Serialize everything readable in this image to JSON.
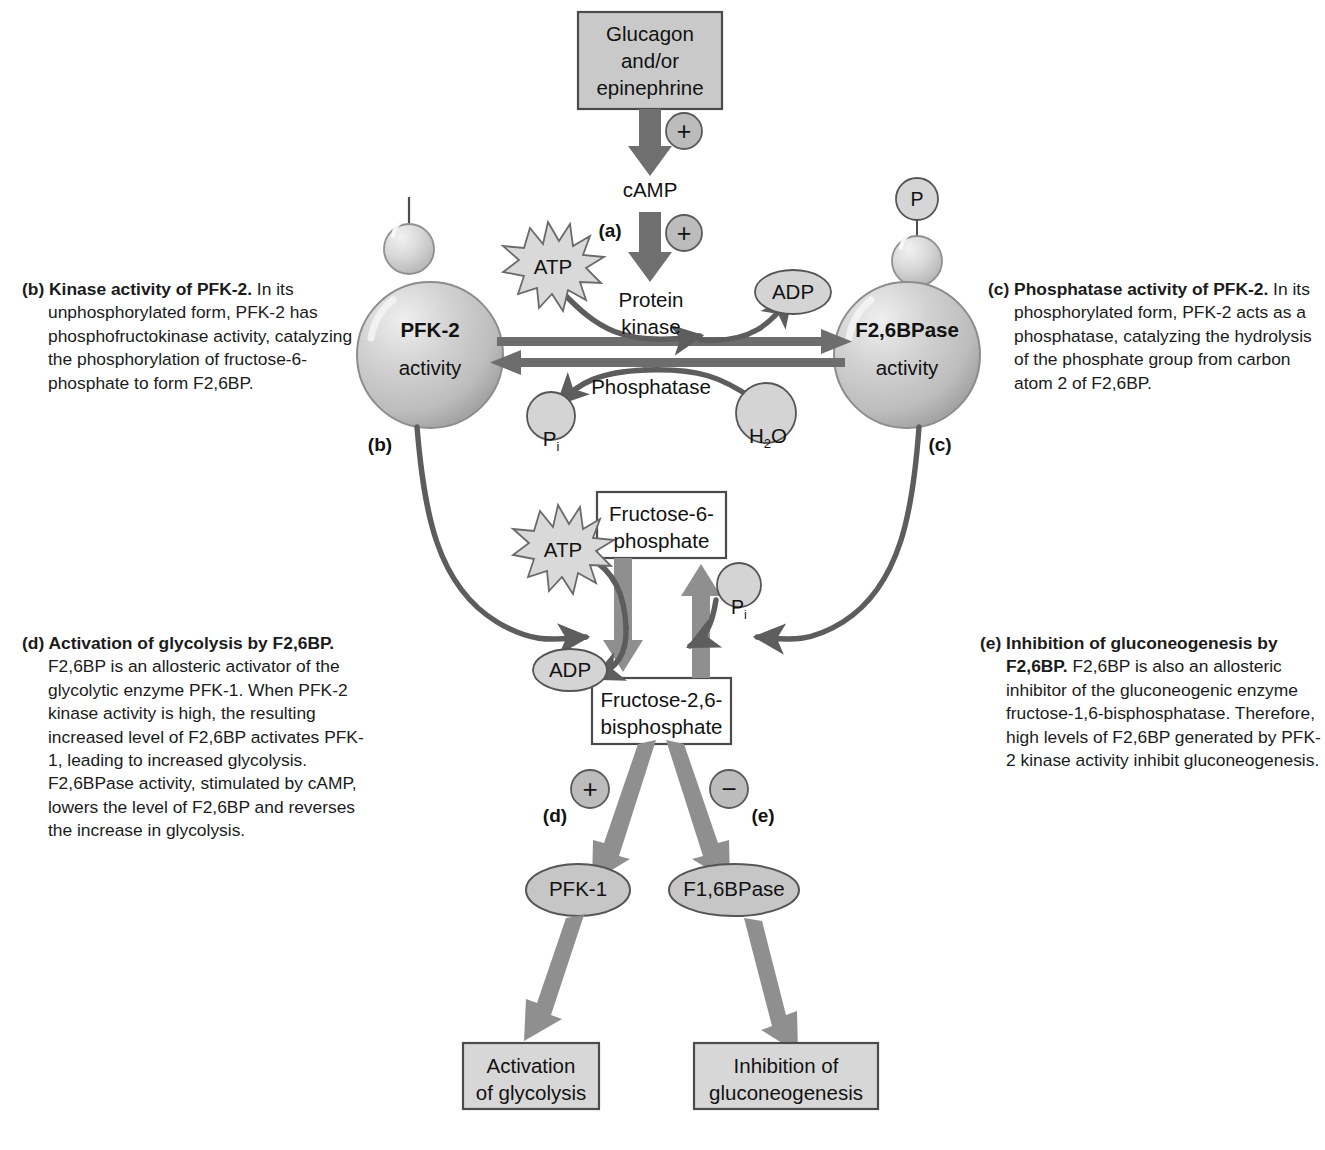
{
  "figure": {
    "colors": {
      "box_fill": "#c9c9c9",
      "box_fill_light": "#ffffff",
      "box_stroke": "#4e4e4e",
      "arrow_gray": "#7c7c7c",
      "arrow_dark": "#5d5d5d",
      "circle_fill": "#cfcfcf",
      "sphere_fill": "#c4c4c4",
      "sphere_stroke": "#8d8d8d",
      "text": "#1b1b1b"
    }
  },
  "nodes": {
    "hormone_box": "Glucagon\nand/or\nepinephrine",
    "camp": "cAMP",
    "protein_kinase": "Protein\nkinase",
    "phosphatase": "Phosphatase",
    "atp_top": "ATP",
    "adp_top": "ADP",
    "pi_top": "P",
    "pi_top_sub": "i",
    "h2o": "H",
    "h2o_sub": "2",
    "h2o_tail": "O",
    "pfk2_name": "PFK-2",
    "pfk2_sub": "activity",
    "f26bpase_name": "F2,6BPase",
    "f26bpase_sub": "activity",
    "phospho_group": "P",
    "f6p": "Fructose-6-\nphosphate",
    "f26bp": "Fructose-2,6-\nbisphosphate",
    "atp_mid": "ATP",
    "adp_mid": "ADP",
    "pi_mid": "P",
    "pi_mid_sub": "i",
    "pfk1": "PFK-1",
    "f16bpase": "F1,6BPase",
    "activation_box": "Activation\nof glycolysis",
    "inhibition_box": "Inhibition of\ngluconeogenesis"
  },
  "signs": {
    "plus_hormone": "+",
    "plus_camp": "+",
    "plus_pfk1": "+",
    "minus_f16bpase": "−"
  },
  "step_labels": {
    "a": "(a)",
    "b_circle": "(b)",
    "c_circle": "(c)",
    "d_arrow": "(d)",
    "e_arrow": "(e)"
  },
  "captions": {
    "b": {
      "marker": "(b)",
      "bold": "Kinase activity of PFK-2.",
      "body": " In its unphosphorylated form, PFK-2 has phosphofructokinase activity, catalyzing the phosphorylation of fructose-6-phosphate to form F2,6BP."
    },
    "c": {
      "marker": "(c)",
      "bold": "Phosphatase activity of PFK-2.",
      "body": " In its phosphorylated form, PFK-2 acts as a phosphatase, catalyzing the hydrolysis of the phosphate group from carbon atom 2 of F2,6BP."
    },
    "d": {
      "marker": "(d)",
      "bold": "Activation of glycolysis by F2,6BP.",
      "body": " F2,6BP is an allosteric activator of the glycolytic enzyme PFK-1. When PFK-2 kinase activity is high, the resulting increased level of F2,6BP activates PFK-1, leading to increased glycolysis. F2,6BPase activity, stimulated by cAMP, lowers the level of F2,6BP and reverses the increase in glycolysis."
    },
    "e": {
      "marker": "(e)",
      "bold": "Inhibition of gluconeogenesis by F2,6BP.",
      "body": " F2,6BP is also an allosteric inhibitor of the gluconeogenic enzyme fructose-1,6-bisphosphatase. Therefore, high levels of F2,6BP generated by PFK-2 kinase activity inhibit gluconeogenesis."
    }
  }
}
